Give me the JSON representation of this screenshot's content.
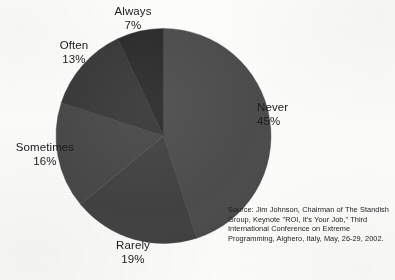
{
  "chart_data": {
    "type": "pie",
    "title": "",
    "subtitle": "",
    "xlabel": "",
    "ylabel": "",
    "legend_position": "outside-labels",
    "grid": false,
    "start_angle_deg": 0,
    "direction": "clockwise",
    "categories": [
      "Never",
      "Rarely",
      "Sometimes",
      "Often",
      "Always"
    ],
    "values": [
      45,
      19,
      16,
      13,
      7
    ],
    "value_unit": "%",
    "slices": [
      {
        "label": "Never",
        "value": 45,
        "value_text": "45%",
        "color": "#4a4a4a",
        "start_deg": 0,
        "end_deg": 162
      },
      {
        "label": "Rarely",
        "value": 19,
        "value_text": "19%",
        "color": "#3f3f3f",
        "start_deg": 162,
        "end_deg": 230.4
      },
      {
        "label": "Sometimes",
        "value": 16,
        "value_text": "16%",
        "color": "#454545",
        "start_deg": 230.4,
        "end_deg": 288
      },
      {
        "label": "Often",
        "value": 13,
        "value_text": "13%",
        "color": "#353535",
        "start_deg": 288,
        "end_deg": 334.8
      },
      {
        "label": "Always",
        "value": 7,
        "value_text": "7%",
        "color": "#282828",
        "start_deg": 334.8,
        "end_deg": 360
      }
    ],
    "annotations": [
      "Source: Jim Johnson, Chairman of The Standish Group, Keynote \"ROI, It's Your Job,\" Third International Conference on Extreme Programming, Alghero, Italy, May, 26-29, 2002."
    ]
  },
  "labels": {
    "always": {
      "name": "Always",
      "value": "7%"
    },
    "often": {
      "name": "Often",
      "value": "13%"
    },
    "sometimes": {
      "name": "Sometimes",
      "value": "16%"
    },
    "rarely": {
      "name": "Rarely",
      "value": "19%"
    },
    "never": {
      "name": "Never",
      "value": "45%"
    }
  },
  "source": {
    "text": "Source: Jim Johnson, Chairman of The Standish Group, Keynote \"ROI, It's Your Job,\" Third International Conference on Extreme Programming, Alghero, Italy, May, 26-29, 2002."
  },
  "colors": {
    "background": "#fdfdfc",
    "text": "#1b1b1b",
    "slice_never": "#4a4a4a",
    "slice_rarely": "#3f3f3f",
    "slice_sometimes": "#454545",
    "slice_often": "#353535",
    "slice_always": "#282828"
  }
}
